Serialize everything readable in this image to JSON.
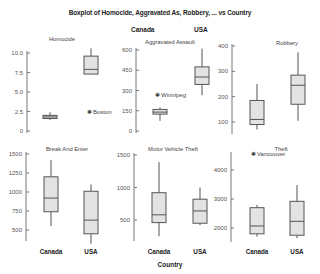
{
  "chart_data": {
    "type": "boxplot",
    "title": "Boxplot of Homocide, Aggravated As, Robbery, ... vs Country",
    "xlabel": "Country",
    "categories": [
      "Canada",
      "USA"
    ],
    "legend_labels": [
      "Canada",
      "USA"
    ],
    "box_fill": "#e3e3e3",
    "box_stroke": "#555555",
    "panels": [
      {
        "name": "Homocide",
        "yticks": [
          0,
          2.5,
          5.0,
          7.5,
          10.0
        ],
        "ytick_labels": [
          "0",
          "2.5",
          "5.0",
          "7.5",
          "10.0"
        ],
        "ylim": [
          0,
          10.5
        ],
        "series": [
          {
            "category": "Canada",
            "min": 1.4,
            "q1": 1.6,
            "median": 1.8,
            "q3": 2.0,
            "max": 2.4
          },
          {
            "category": "USA",
            "min": 7.3,
            "q1": 7.3,
            "median": 7.9,
            "q3": 9.6,
            "max": 10.6
          }
        ],
        "outliers": [
          {
            "label": "Boston",
            "category": "USA",
            "value": 2.5
          }
        ]
      },
      {
        "name": "Aggravated Assault",
        "yticks": [
          0,
          150,
          300,
          450,
          600
        ],
        "ytick_labels": [
          "0",
          "150",
          "300",
          "450",
          "600"
        ],
        "ylim": [
          0,
          620
        ],
        "series": [
          {
            "category": "Canada",
            "min": 75,
            "q1": 125,
            "median": 140,
            "q3": 160,
            "max": 175
          },
          {
            "category": "USA",
            "min": 265,
            "q1": 345,
            "median": 400,
            "q3": 475,
            "max": 610
          }
        ],
        "outliers": [
          {
            "label": "Winnipeg",
            "category": "Canada",
            "value": 265
          }
        ]
      },
      {
        "name": "Robbery",
        "yticks": [
          100,
          200,
          300,
          400
        ],
        "ytick_labels": [
          "100",
          "200",
          "300",
          "400"
        ],
        "ylim": [
          50,
          410
        ],
        "series": [
          {
            "category": "Canada",
            "min": 70,
            "q1": 90,
            "median": 110,
            "q3": 185,
            "max": 250
          },
          {
            "category": "USA",
            "min": 105,
            "q1": 170,
            "median": 245,
            "q3": 285,
            "max": 375
          }
        ],
        "outliers": []
      },
      {
        "name": "Break And Enter",
        "yticks": [
          500,
          750,
          1000,
          1250,
          1500
        ],
        "ytick_labels": [
          "500",
          "750",
          "1000",
          "1250",
          "1500"
        ],
        "ylim": [
          350,
          1550
        ],
        "series": [
          {
            "category": "Canada",
            "min": 550,
            "q1": 740,
            "median": 920,
            "q3": 1200,
            "max": 1420
          },
          {
            "category": "USA",
            "min": 320,
            "q1": 450,
            "median": 630,
            "q3": 1010,
            "max": 1100
          }
        ],
        "outliers": []
      },
      {
        "name": "Motor Vehicle Theft",
        "yticks": [
          500,
          1000,
          1500
        ],
        "ytick_labels": [
          "500",
          "1000",
          "1500"
        ],
        "ylim": [
          150,
          1550
        ],
        "series": [
          {
            "category": "Canada",
            "min": 250,
            "q1": 460,
            "median": 580,
            "q3": 920,
            "max": 1390
          },
          {
            "category": "USA",
            "min": 420,
            "q1": 450,
            "median": 640,
            "q3": 820,
            "max": 1000
          }
        ],
        "outliers": []
      },
      {
        "name": "Theft",
        "yticks": [
          2000,
          3000,
          4000
        ],
        "ytick_labels": [
          "2000",
          "3000",
          "4000"
        ],
        "ylim": [
          1500,
          4700
        ],
        "series": [
          {
            "category": "Canada",
            "min": 1700,
            "q1": 1800,
            "median": 2070,
            "q3": 2700,
            "max": 2800
          },
          {
            "category": "USA",
            "min": 1650,
            "q1": 1750,
            "median": 2230,
            "q3": 2920,
            "max": 3480
          }
        ],
        "outliers": [
          {
            "label": "Vancouver",
            "category": "Canada",
            "value": 4550
          }
        ]
      }
    ],
    "grid": false,
    "legend_position": "top"
  }
}
